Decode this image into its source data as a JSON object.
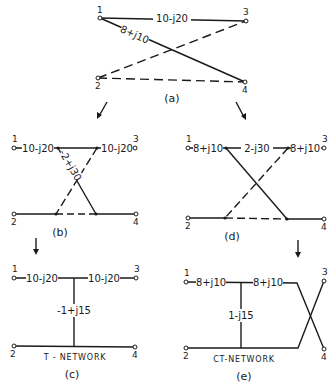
{
  "figure": {
    "panel_a": {
      "caption": "(a)",
      "nodes": [
        "1",
        "2",
        "3",
        "4"
      ],
      "branch_13_label": "10-j20",
      "branch_14_label": "8+j10"
    },
    "panel_b": {
      "caption": "(b)",
      "nodes": [
        "1",
        "2",
        "3",
        "4"
      ],
      "left_series_label": "10-j20",
      "right_series_label": "10-j20",
      "cross_label": "-2+j30"
    },
    "panel_c": {
      "caption": "(c)",
      "nodes": [
        "1",
        "2",
        "3",
        "4"
      ],
      "left_series_label": "10-j20",
      "right_series_label": "10-j20",
      "shunt_label": "-1+j15",
      "network_name": "T - NETWORK"
    },
    "panel_d": {
      "caption": "(d)",
      "nodes": [
        "1",
        "2",
        "3",
        "4"
      ],
      "left_series_label": "8+j10",
      "middle_label": "2-j30",
      "right_series_label": "8+j10"
    },
    "panel_e": {
      "caption": "(e)",
      "nodes": [
        "1",
        "2",
        "3",
        "4"
      ],
      "left_series_label": "8+j10",
      "right_series_label": "8+j10",
      "shunt_label": "1-j15",
      "network_name": "CT-NETWORK"
    }
  }
}
